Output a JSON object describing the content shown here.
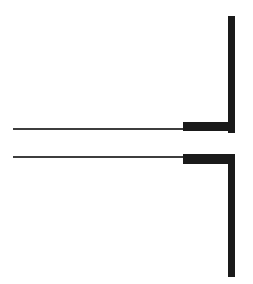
{
  "document": {
    "title": "Technical Line Drawing",
    "background_color": "#ffffff",
    "ink_color": "#1a1a1a",
    "ink_soft_color": "#3d3d3d",
    "width": 253,
    "height": 284,
    "caption": "",
    "labels": []
  },
  "figure": {
    "name": "bracket-with-break",
    "stroke_units": "px",
    "elements": [
      {
        "id": "vertical-post-upper",
        "kind": "vertical-bar",
        "x": 228,
        "y": 16,
        "width": 7,
        "height": 117,
        "color": "#1a1a1a"
      },
      {
        "id": "vertical-post-lower",
        "kind": "vertical-bar",
        "x": 228,
        "y": 154,
        "width": 7,
        "height": 123,
        "color": "#1a1a1a"
      },
      {
        "id": "upper-thin-rule",
        "kind": "horizontal-rule",
        "x": 13,
        "y": 128,
        "width": 171,
        "height": 2,
        "color": "#3d3d3d"
      },
      {
        "id": "upper-thick-segment",
        "kind": "horizontal-bar",
        "x": 183,
        "y": 122,
        "width": 52,
        "height": 9,
        "color": "#1a1a1a"
      },
      {
        "id": "lower-thin-rule",
        "kind": "horizontal-rule",
        "x": 13,
        "y": 156,
        "width": 171,
        "height": 2,
        "color": "#3d3d3d"
      },
      {
        "id": "lower-thick-segment",
        "kind": "horizontal-bar",
        "x": 183,
        "y": 154,
        "width": 52,
        "height": 10,
        "color": "#1a1a1a"
      },
      {
        "id": "post-gap",
        "kind": "gap",
        "x": 228,
        "y": 133,
        "width": 7,
        "height": 21,
        "color": "#ffffff"
      }
    ]
  }
}
